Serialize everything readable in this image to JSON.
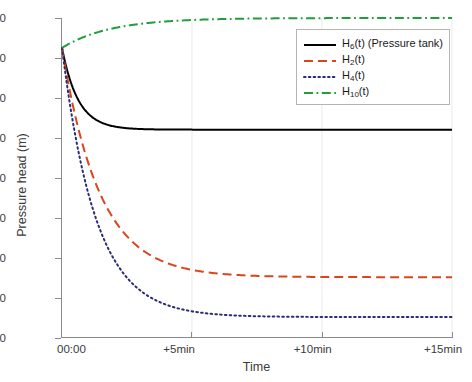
{
  "chart_data": {
    "type": "line",
    "title": "",
    "xlabel": "Time",
    "ylabel": "Pressure head (m)",
    "xlim": [
      0,
      15
    ],
    "ylim": [
      30,
      110
    ],
    "x_unit": "minutes",
    "xticks": [
      0,
      5,
      10,
      15
    ],
    "xticklabels": [
      "00:00",
      "+5min",
      "+10min",
      "+15min"
    ],
    "yticks": [
      30,
      40,
      50,
      60,
      70,
      80,
      90,
      100,
      110
    ],
    "yticklabels": [
      "30",
      "40",
      "50",
      "60",
      "70",
      "80",
      "90",
      "100",
      "110"
    ],
    "grid": "vertical-only",
    "legend_position": "top-right-inside",
    "initial_value": 102.5,
    "series": [
      {
        "name": "H6(t) (Pressure tank)",
        "label_base": "H",
        "label_sub": "6",
        "label_suffix": "(t) (Pressure tank)",
        "color": "#000000",
        "style": "solid",
        "width": 2.0,
        "start": 102.5,
        "asymptote": 82.0,
        "tau_min": 0.62,
        "x": [
          0,
          0.15,
          0.3,
          0.5,
          0.75,
          1.0,
          1.25,
          1.5,
          2.0,
          2.5,
          3.0,
          4.0,
          5.0,
          7.5,
          10.0,
          12.5,
          15.0
        ],
        "y": [
          102.5,
          98.9,
          96.1,
          93.2,
          90.6,
          88.6,
          87.2,
          86.1,
          84.6,
          83.7,
          83.2,
          82.6,
          82.3,
          82.1,
          82.0,
          82.0,
          82.0
        ]
      },
      {
        "name": "H2(t)",
        "label_base": "H",
        "label_sub": "2",
        "label_suffix": "(t)",
        "color": "#D9461E",
        "style": "dashed",
        "width": 2.0,
        "start": 102.5,
        "asymptote": 45.0,
        "tau_min": 1.45,
        "x": [
          0,
          0.25,
          0.5,
          0.75,
          1.0,
          1.5,
          2.0,
          2.5,
          3.0,
          3.5,
          4.0,
          5.0,
          6.0,
          7.5,
          10.0,
          12.5,
          15.0
        ],
        "y": [
          102.5,
          93.6,
          85.6,
          78.6,
          72.6,
          63.2,
          56.6,
          52.1,
          49.2,
          47.4,
          46.3,
          45.4,
          45.1,
          45.0,
          45.0,
          45.0,
          45.0
        ]
      },
      {
        "name": "H4(t)",
        "label_base": "H",
        "label_sub": "4",
        "label_suffix": "(t)",
        "color": "#2B2B7A",
        "style": "dotted",
        "width": 2.0,
        "start": 102.5,
        "asymptote": 35.0,
        "tau_min": 1.3,
        "x": [
          0,
          0.25,
          0.5,
          0.75,
          1.0,
          1.5,
          2.0,
          2.5,
          3.0,
          3.5,
          4.0,
          5.0,
          6.0,
          7.5,
          10.0,
          12.5,
          15.0
        ],
        "y": [
          102.5,
          91.1,
          81.5,
          73.4,
          66.6,
          56.4,
          49.6,
          45.2,
          42.3,
          40.5,
          39.2,
          37.6,
          36.6,
          35.8,
          35.2,
          35.1,
          35.0
        ]
      },
      {
        "name": "H10(t)",
        "label_base": "H",
        "label_sub": "10",
        "label_suffix": "(t)",
        "color": "#1E9E3C",
        "style": "dashdot",
        "width": 2.0,
        "start": 102.5,
        "asymptote": 110.0,
        "tau_min": 1.85,
        "x": [
          0,
          0.25,
          0.5,
          0.75,
          1.0,
          1.5,
          2.0,
          2.5,
          3.0,
          4.0,
          5.0,
          6.0,
          7.5,
          10.0,
          12.5,
          15.0
        ],
        "y": [
          102.5,
          103.5,
          104.4,
          105.2,
          105.9,
          107.0,
          107.8,
          108.4,
          108.8,
          109.3,
          109.6,
          109.8,
          109.9,
          110.0,
          110.0,
          110.0
        ]
      }
    ]
  },
  "axis": {
    "ylabel": "Pressure head (m)",
    "xlabel": "Time",
    "yticklabels": [
      "110",
      "100",
      "90",
      "80",
      "70",
      "60",
      "50",
      "40",
      "30"
    ],
    "xticklabels": [
      "00:00",
      "+5min",
      "+10min",
      "+15min"
    ]
  },
  "legend": {
    "items": [
      {
        "base": "H",
        "sub": "6",
        "suffix": "(t) (Pressure tank)",
        "color": "#000000",
        "style": "solid"
      },
      {
        "base": "H",
        "sub": "2",
        "suffix": "(t)",
        "color": "#D9461E",
        "style": "dashed"
      },
      {
        "base": "H",
        "sub": "4",
        "suffix": "(t)",
        "color": "#2B2B7A",
        "style": "dotted"
      },
      {
        "base": "H",
        "sub": "10",
        "suffix": "(t)",
        "color": "#1E9E3C",
        "style": "dashdot"
      }
    ]
  },
  "colors": {
    "axis": "#8a8a8a",
    "text": "#3b3b3b",
    "grid": "#eceaea",
    "background": "#ffffff"
  }
}
